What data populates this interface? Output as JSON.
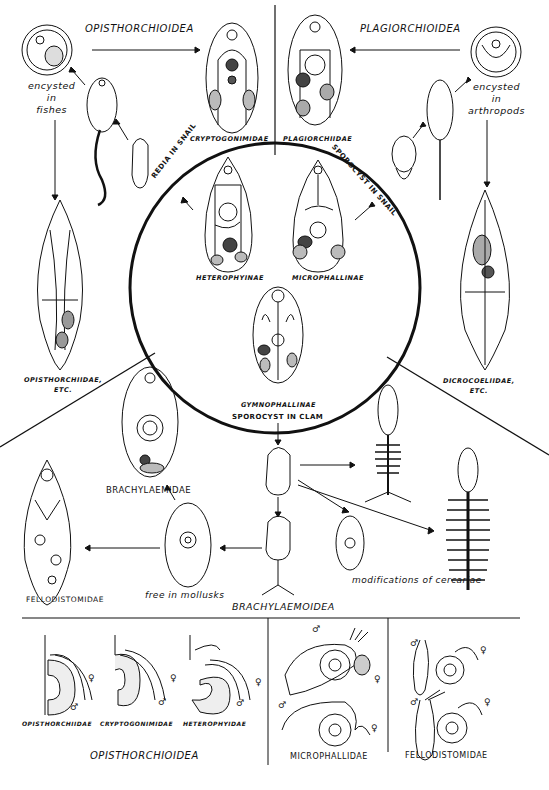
{
  "superfamilies": {
    "opisthorchioidea": "OPISTHORCHIOIDEA",
    "plagiorchioidea": "PLAGIORCHIOIDEA",
    "brachylaemoidea": "BRACHYLAEMOIDEA"
  },
  "habitats": {
    "fishes": "encysted in fishes",
    "fishes_lines": [
      "encysted",
      "in",
      "fishes"
    ],
    "arthropods_lines": [
      "encysted",
      "in",
      "arthropods"
    ],
    "mollusks": "free in mollusks",
    "modifications": "modifications of cercariae"
  },
  "stages": {
    "redia_snail": "REDIA IN SNAIL",
    "sporocyst_snail": "SPOROCYST IN SNAIL",
    "sporocyst_clam": "SPOROCYST IN CLAM"
  },
  "families": {
    "cryptogonimidae": "CRYPTOGONIMIDAE",
    "plagiorchiidae": "PLAGIORCHIIDAE",
    "heterophyinae": "HETEROPHYINAE",
    "microphallinae": "MICROPHALLINAE",
    "gymnophallinae": "GYMNOPHALLINAE",
    "opisthorchiidae_etc": [
      "OPISTHORCHIIDAE,",
      "ETC."
    ],
    "dicrocoeliidae_etc": [
      "DICROCOELIIDAE,",
      "ETC."
    ],
    "brachylaemidae": "BRACHYLAEMIDAE",
    "fellodistomidae": "FELLODISTOMIDAE"
  },
  "bottom_panel": {
    "left_group": {
      "items": [
        "OPISTHORCHIIDAE",
        "CRYPTOGONIMIDAE",
        "HETEROPHYIDAE"
      ],
      "title": "OPISTHORCHIOIDEA"
    },
    "middle_title": "MICROPHALLIDAE",
    "right_title": "FELLODISTOMIDAE",
    "male_symbol": "♂",
    "female_symbol": "♀"
  }
}
